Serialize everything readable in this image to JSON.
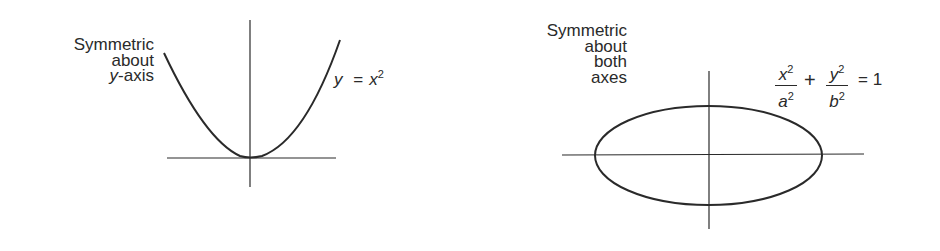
{
  "figures": [
    {
      "id": "parabola",
      "caption_lines": [
        "Symmetric",
        "about",
        "y-axis"
      ],
      "caption_line3_italic_var": "y",
      "caption_line3_rest": "-axis",
      "equation": {
        "lhs": "y",
        "op": "=",
        "rhs_base": "x",
        "rhs_exp": "2"
      },
      "curve": "y = x^2"
    },
    {
      "id": "ellipse",
      "caption_lines": [
        "Symmetric",
        "about",
        "both",
        "axes"
      ],
      "equation": {
        "term1_num": "x",
        "term1_num_exp": "2",
        "term1_den": "a",
        "term1_den_exp": "2",
        "plus": "+",
        "term2_num": "y",
        "term2_num_exp": "2",
        "term2_den": "b",
        "term2_den_exp": "2",
        "equals": "= 1"
      },
      "curve": "x^2/a^2 + y^2/b^2 = 1"
    }
  ],
  "colors": {
    "stroke": "#2a2a2a",
    "background": "#ffffff"
  }
}
